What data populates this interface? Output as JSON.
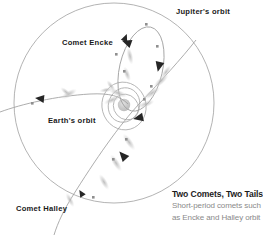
{
  "labels": {
    "jupiter_orbit": "Jupiter's orbit",
    "comet_encke": "Comet Encke",
    "earth_orbit": "Earth's orbit",
    "comet_halley": "Comet Halley"
  },
  "caption": {
    "title": "Two Comets, Two Tails",
    "line1": "Short-period comets such",
    "line2": "as Encke and Halley orbit"
  },
  "colors": {
    "orbit_line": "#9a9a9a",
    "orbit_line_light": "#b4b4b4",
    "arrowhead": "#262626",
    "comet_marker": "#8f8f8f",
    "comet_tail": "#c9c9c9",
    "sun": "#c4c4c4",
    "label_text": "#1a1a1a",
    "caption_title": "#1c1c1c",
    "caption_sub": "#8a8a8a",
    "background": "#ffffff"
  },
  "diagram": {
    "type": "orbital-schematic",
    "sun": {
      "cx": 124,
      "cy": 106,
      "r": 6
    },
    "jupiter_orbit": {
      "cx": 114,
      "cy": 103,
      "r": 100
    },
    "earth_orbit_system": [
      {
        "cx": 124,
        "cy": 106,
        "rx": 22,
        "ry": 24,
        "rotate": -15
      },
      {
        "cx": 124,
        "cy": 105,
        "rx": 15,
        "ry": 17,
        "rotate": 20
      },
      {
        "cx": 126,
        "cy": 107,
        "rx": 12,
        "ry": 13,
        "rotate": -40
      }
    ],
    "encke_orbit": {
      "cx": 140,
      "cy": 68,
      "rx": 22,
      "ry": 44,
      "rotate": 14
    },
    "halley_orbit_note": "long steep path from upper-right through the Sun to lower-left, crossing Jupiter's orbit twice",
    "arrowheads": 6,
    "comet_markers": 10
  }
}
